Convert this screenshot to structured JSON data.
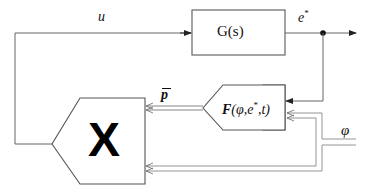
{
  "diagram": {
    "type": "block-diagram",
    "blocks": {
      "plant": {
        "label": "G(s)"
      },
      "function_block": {
        "label": "F(φ,e*,t)"
      },
      "multiplier": {
        "label": "X"
      }
    },
    "signals": {
      "control_input": {
        "label": "u"
      },
      "output": {
        "label": "e",
        "superscript": "*"
      },
      "parameter_vector": {
        "label": "p"
      },
      "external_input": {
        "label": "φ"
      }
    },
    "function_block_text": {
      "name": "F",
      "args": "(φ,e",
      "sup": "*",
      "tail": ",t)"
    },
    "colors": {
      "line": "#555555",
      "text": "#111111",
      "background": "#ffffff"
    }
  }
}
